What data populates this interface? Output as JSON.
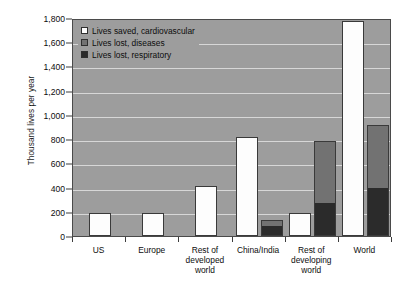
{
  "chart_data": {
    "type": "bar",
    "title": "",
    "subtitle": "",
    "xlabel": "",
    "ylabel": "Thousand lives per year",
    "ylim": [
      0,
      1800
    ],
    "ytick_step": 200,
    "ytick_labels": [
      "0",
      "200",
      "400",
      "600",
      "800",
      "1,000",
      "1,200",
      "1,400",
      "1,600",
      "1,800"
    ],
    "ytick_values": [
      0,
      200,
      400,
      600,
      800,
      1000,
      1200,
      1400,
      1600,
      1800
    ],
    "grid": true,
    "legend_position": "top-left",
    "grouping": "grouped-with-stacked-losses",
    "categories": [
      "US",
      "Europe",
      "Rest of\ndeveloped\nworld",
      "China/India",
      "Rest of\ndeveloping\nworld",
      "World"
    ],
    "series": [
      {
        "name": "Lives saved, cardiovascular",
        "color": "#fdfdfd",
        "values": [
          190,
          190,
          410,
          820,
          190,
          1775
        ]
      },
      {
        "name": "Lives lost, diseases",
        "color": "#727272",
        "values": [
          0,
          0,
          0,
          55,
          520,
          530
        ]
      },
      {
        "name": "Lives lost, respiratory",
        "color": "#2b2b2b",
        "values": [
          0,
          0,
          0,
          75,
          265,
          385
        ]
      }
    ],
    "loss_totals": [
      0,
      0,
      0,
      130,
      785,
      915
    ]
  },
  "legend": {
    "items": [
      {
        "label": "Lives saved, cardiovascular",
        "swatch": "white"
      },
      {
        "label": "Lives lost, diseases",
        "swatch": "gray"
      },
      {
        "label": "Lives lost, respiratory",
        "swatch": "dark"
      }
    ]
  },
  "colors": {
    "plot_background": "#9d9d9d",
    "gridline": "#d7d7d7",
    "axis": "#3d3d3d",
    "saved": "#fdfdfd",
    "diseases": "#727272",
    "respiratory": "#2b2b2b"
  }
}
